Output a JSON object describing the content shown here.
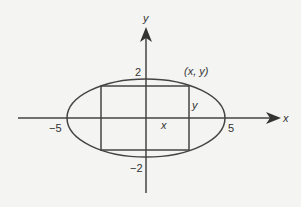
{
  "diagram": {
    "axes": {
      "x_label": "x",
      "y_label": "y"
    },
    "ticks": {
      "x_neg": "−5",
      "x_pos": "5",
      "y_pos": "2",
      "y_neg": "−2"
    },
    "labels": {
      "corner_point": "(x, y)",
      "half_width": "x",
      "half_height": "y"
    },
    "colors": {
      "line": "#444444",
      "background": "#f4f4f2"
    }
  }
}
